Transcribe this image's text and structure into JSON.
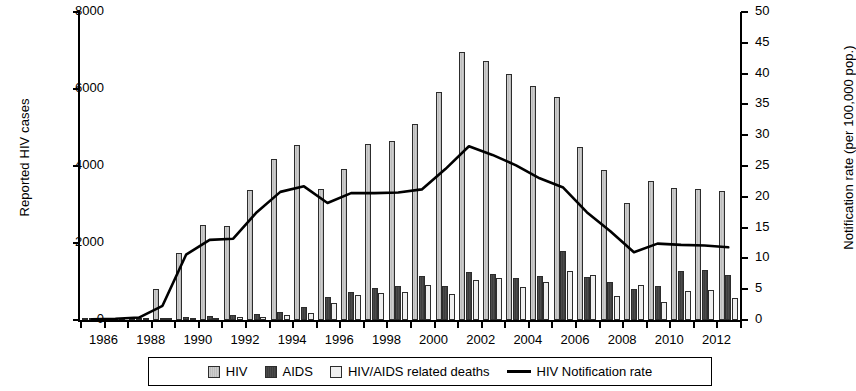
{
  "chart_data": {
    "type": "bar",
    "title": "",
    "xlabel": "",
    "ylabel": "Reported HIV cases",
    "y2label": "Notification rate (per 100,000 pop.)",
    "ylim": [
      0,
      8000
    ],
    "y2lim": [
      0,
      50
    ],
    "yticks": [
      0,
      2000,
      4000,
      6000,
      8000
    ],
    "y2ticks": [
      0,
      5,
      10,
      15,
      20,
      25,
      30,
      35,
      40,
      45,
      50
    ],
    "grid": false,
    "legend_position": "bottom",
    "categories": [
      1986,
      1987,
      1988,
      1989,
      1990,
      1991,
      1992,
      1993,
      1994,
      1995,
      1996,
      1997,
      1998,
      1999,
      2000,
      2001,
      2002,
      2003,
      2004,
      2005,
      2006,
      2007,
      2008,
      2009,
      2010,
      2011,
      2012,
      2013
    ],
    "xtick_labels": [
      "1986",
      "1988",
      "1990",
      "1992",
      "1994",
      "1996",
      "1998",
      "2000",
      "2002",
      "2004",
      "2006",
      "2008",
      "2010",
      "2012"
    ],
    "series": [
      {
        "name": "HIV",
        "axis": "left",
        "color": "#c6c6c6",
        "values": [
          20,
          40,
          70,
          800,
          1750,
          2480,
          2440,
          3380,
          4180,
          4550,
          3400,
          3920,
          4580,
          4640,
          5080,
          5930,
          6950,
          6720,
          6380,
          6080,
          5800,
          4500,
          3900,
          3030,
          3600,
          3430,
          3400,
          3350
        ]
      },
      {
        "name": "AIDS",
        "axis": "left",
        "color": "#464646",
        "values": [
          10,
          20,
          40,
          60,
          80,
          100,
          120,
          150,
          200,
          340,
          600,
          740,
          830,
          880,
          1150,
          880,
          1250,
          1200,
          1080,
          1150,
          1790,
          1130,
          990,
          800,
          880,
          1280,
          1300,
          1170
        ]
      },
      {
        "name": "HIV/AIDS related deaths",
        "axis": "left",
        "color": "#efefef",
        "values": [
          5,
          10,
          20,
          30,
          50,
          60,
          70,
          90,
          120,
          180,
          440,
          640,
          700,
          740,
          900,
          680,
          1050,
          1080,
          860,
          980,
          1280,
          1180,
          620,
          900,
          480,
          760,
          790,
          580
        ]
      },
      {
        "name": "HIV Notification rate",
        "axis": "right",
        "type": "line",
        "color": "#000000",
        "values": [
          0.1,
          0.2,
          0.4,
          2.3,
          10.6,
          13.0,
          13.2,
          17.5,
          20.8,
          21.7,
          19.0,
          20.6,
          20.6,
          20.7,
          21.2,
          24.5,
          28.2,
          26.8,
          25.1,
          23.0,
          21.5,
          17.5,
          14.4,
          11.0,
          12.4,
          12.2,
          12.1,
          11.8
        ]
      }
    ]
  },
  "axes": {
    "left_title": "Reported HIV cases",
    "right_title": "Notification rate (per 100,000 pop.)"
  },
  "legend": {
    "items": [
      {
        "label": "HIV",
        "swatch": "hiv"
      },
      {
        "label": "AIDS",
        "swatch": "aids"
      },
      {
        "label": "HIV/AIDS related deaths",
        "swatch": "deaths"
      },
      {
        "label": "HIV Notification rate",
        "swatch": "line"
      }
    ]
  }
}
